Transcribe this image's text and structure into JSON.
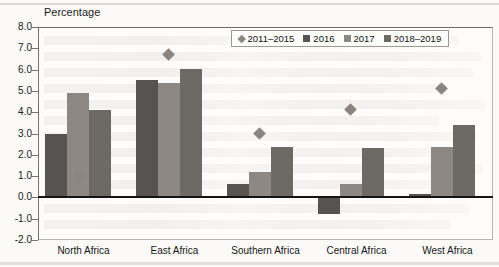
{
  "chart_data": {
    "type": "bar",
    "title": "Percentage",
    "xlabel": "",
    "ylabel": "Percentage",
    "ylim": [
      -2.0,
      8.0
    ],
    "ytick_step": 1.0,
    "yticks": [
      "8.0",
      "7.0",
      "6.0",
      "5.0",
      "4.0",
      "3.0",
      "2.0",
      "1.0",
      "0.0",
      "-1.0",
      "-2.0"
    ],
    "grid": false,
    "legend_position": "top-right",
    "categories": [
      "North Africa",
      "East Africa",
      "Southern Africa",
      "Central Africa",
      "West Africa"
    ],
    "series": [
      {
        "name": "2011–2015",
        "type": "marker",
        "marker": "diamond",
        "color": "#8a8580",
        "values": [
          1.0,
          6.7,
          3.0,
          4.15,
          5.1
        ]
      },
      {
        "name": "2016",
        "type": "bar",
        "color": "#575351",
        "values": [
          3.0,
          5.5,
          0.65,
          -0.8,
          0.15
        ]
      },
      {
        "name": "2017",
        "type": "bar",
        "color": "#8d8883",
        "values": [
          4.9,
          5.35,
          1.2,
          0.65,
          2.35
        ]
      },
      {
        "name": "2018–2019",
        "type": "bar",
        "color": "#6d6965",
        "values": [
          4.1,
          6.05,
          2.35,
          2.3,
          3.4
        ]
      }
    ]
  },
  "colors": {
    "series_2011_2015": "#8a8580",
    "series_2016": "#575351",
    "series_2017": "#8d8883",
    "series_2018_2019": "#6d6965",
    "axis": "#77726c",
    "zero_line": "#151515",
    "text": "#1b1b1b",
    "page_background": "#fbfaf8"
  }
}
